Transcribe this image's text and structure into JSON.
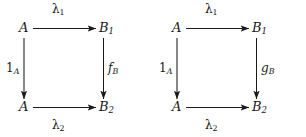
{
  "figure": {
    "type": "commutative-diagram-pair",
    "background_color": "#ffffff",
    "stroke_color": "#1a1a1a",
    "text_color": "#1a1a1a",
    "diagrams": [
      {
        "id": "left",
        "nodes": {
          "top_left": "A",
          "top_right_base": "B",
          "top_right_sub": "1",
          "bottom_left": "A",
          "bottom_right_base": "B",
          "bottom_right_sub": "2"
        },
        "edges": {
          "top_base": "λ",
          "top_sub": "1",
          "bottom_base": "λ",
          "bottom_sub": "2",
          "left_base": "1",
          "left_sub": "A",
          "right_base": "f",
          "right_sub": "B"
        }
      },
      {
        "id": "right",
        "nodes": {
          "top_left": "A",
          "top_right_base": "B",
          "top_right_sub": "1",
          "bottom_left": "A",
          "bottom_right_base": "B",
          "bottom_right_sub": "2"
        },
        "edges": {
          "top_base": "λ",
          "top_sub": "1",
          "bottom_base": "λ",
          "bottom_sub": "2",
          "left_base": "1",
          "left_sub": "A",
          "right_base": "g",
          "right_sub": "B"
        }
      }
    ]
  }
}
